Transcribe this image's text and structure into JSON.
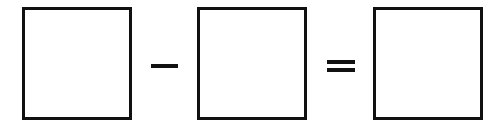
{
  "equation": {
    "operands": [
      {
        "id": "box-1",
        "value": "",
        "placeholder": ""
      },
      {
        "id": "box-2",
        "value": "",
        "placeholder": ""
      }
    ],
    "result": {
      "id": "box-3",
      "value": "",
      "placeholder": ""
    },
    "operator_symbol": "−",
    "operator_name": "minus",
    "equals_symbol": "=",
    "colors": {
      "stroke": "#111111",
      "background": "#ffffff"
    }
  }
}
